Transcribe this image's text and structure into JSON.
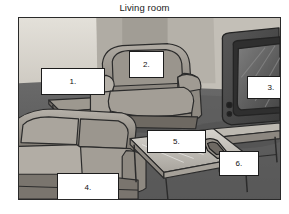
{
  "page": {
    "title": "Living room",
    "background_color": "#ffffff"
  },
  "photo": {
    "name": "living-room-photograph",
    "alt": "Photograph of a living room interior with sofa, armchair, side table, coffee table and television",
    "frame": {
      "border_color": "#2a2a2a",
      "x": 18,
      "y": 17,
      "width": 263,
      "height": 183
    },
    "palette": {
      "wall_light": "#d9d6cf",
      "wall_shadow": "#b9b5ad",
      "floor": "#6f6f6f",
      "floor_dark": "#575757",
      "upholstery_light": "#a9a49c",
      "upholstery_mid": "#8d8880",
      "upholstery_dark": "#6c6761",
      "wood": "#7d7872",
      "tv_body": "#4a4a4a",
      "tv_screen": "#6b6b6b",
      "outline": "#2b2b2b"
    },
    "objects": [
      {
        "name": "wall",
        "region": "background"
      },
      {
        "name": "side-table",
        "region": "left"
      },
      {
        "name": "armchair",
        "region": "center"
      },
      {
        "name": "television",
        "region": "right"
      },
      {
        "name": "tv-stand",
        "region": "right-lower"
      },
      {
        "name": "sofa",
        "region": "bottom-left"
      },
      {
        "name": "coffee-table",
        "region": "bottom-center"
      },
      {
        "name": "remote-control",
        "region": "bottom-center"
      }
    ]
  },
  "callouts": [
    {
      "id": 1,
      "label": "1.",
      "name": "callout-label-1"
    },
    {
      "id": 2,
      "label": "2.",
      "name": "callout-label-2"
    },
    {
      "id": 3,
      "label": "3.",
      "name": "callout-label-3"
    },
    {
      "id": 4,
      "label": "4.",
      "name": "callout-label-4"
    },
    {
      "id": 5,
      "label": "5.",
      "name": "callout-label-5"
    },
    {
      "id": 6,
      "label": "6.",
      "name": "callout-label-6"
    }
  ]
}
